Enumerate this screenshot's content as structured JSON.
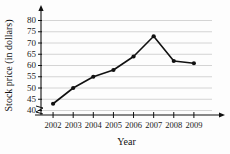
{
  "chart_data": {
    "type": "line",
    "title": "",
    "xlabel": "Year",
    "ylabel": "Stock price (in dollars)",
    "categories": [
      "2002",
      "2003",
      "2004",
      "2005",
      "2006",
      "2007",
      "2008",
      "2009"
    ],
    "x": [
      2002,
      2003,
      2004,
      2005,
      2006,
      2007,
      2008,
      2009
    ],
    "values": [
      43,
      50,
      55,
      58,
      64,
      73,
      62,
      61
    ],
    "series": [
      {
        "name": "Stock price",
        "values": [
          43,
          50,
          55,
          58,
          64,
          73,
          62,
          61
        ]
      }
    ],
    "ylim": [
      38,
      82
    ],
    "y_ticks": [
      40,
      45,
      50,
      55,
      60,
      65,
      70,
      75,
      80
    ],
    "y_tick_labels": [
      "40",
      "45",
      "50",
      "55",
      "60",
      "65",
      "70",
      "75",
      "80"
    ],
    "xlim": [
      2001.4,
      2009.9
    ],
    "grid": true,
    "grid_axis": "y",
    "legend": false,
    "legend_position": "none",
    "marker": "filled-circle",
    "axis_break": true,
    "axis_break_note": "zigzag break on y-axis below 40",
    "arrows": {
      "y_axis": "up",
      "x_axis": "right"
    },
    "colors": {
      "line": "#111111",
      "marker": "#111111",
      "grid": "#c9c9c9",
      "axis": "#111111",
      "background": "#fdfdfd",
      "text": "#1a1a1a"
    },
    "annotations": []
  }
}
